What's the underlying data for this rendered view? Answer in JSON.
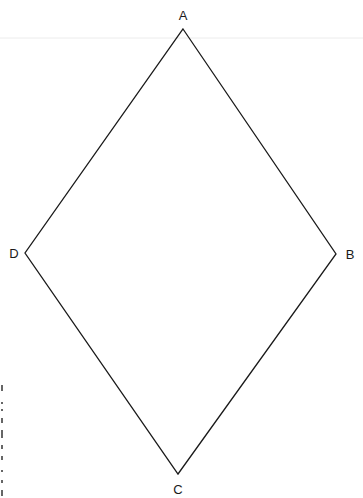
{
  "diagram": {
    "type": "rhombus",
    "stroke_color": "#1a1a1a",
    "stroke_width": 1.3,
    "background": "#ffffff",
    "vertices": [
      {
        "name": "A",
        "label": "A",
        "x": 183,
        "y": 29,
        "label_x": 183,
        "label_y": 20
      },
      {
        "name": "B",
        "label": "B",
        "x": 336,
        "y": 254,
        "label_x": 350,
        "label_y": 259
      },
      {
        "name": "C",
        "label": "C",
        "x": 178,
        "y": 474,
        "label_x": 178,
        "label_y": 494
      },
      {
        "name": "D",
        "label": "D",
        "x": 25,
        "y": 253,
        "label_x": 14,
        "label_y": 258
      }
    ],
    "edges": [
      [
        "A",
        "B"
      ],
      [
        "B",
        "C"
      ],
      [
        "C",
        "D"
      ],
      [
        "D",
        "A"
      ]
    ]
  },
  "artifacts": {
    "top_faint_line": {
      "y": 38,
      "color": "#ececec"
    },
    "left_scan_marks": {
      "x": 2,
      "y_start": 385,
      "y_end": 496,
      "color": "#333333"
    }
  }
}
